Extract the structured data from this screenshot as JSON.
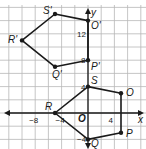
{
  "figure": {
    "type": "coordinate-plane",
    "axes": {
      "x_label": "x",
      "y_label": "y",
      "origin_label": "O",
      "x_ticks": [
        {
          "value": -8,
          "label": "−8"
        },
        {
          "value": -4,
          "label": "−4"
        },
        {
          "value": 4,
          "label": "4"
        }
      ],
      "y_ticks": [
        {
          "value": 4,
          "label": "4"
        },
        {
          "value": -4,
          "label": "−4"
        },
        {
          "value": 8,
          "label": "8"
        },
        {
          "value": 12,
          "label": "12"
        }
      ]
    },
    "colors": {
      "grid": "#b8b8b8",
      "axis": "#1a1a1a",
      "polygon": "#1a1a1a",
      "background": "#ffffff"
    },
    "preimage": {
      "name": "RSOPQ",
      "vertices": [
        {
          "label": "R",
          "x": -5,
          "y": 0
        },
        {
          "label": "S",
          "x": 0,
          "y": 4
        },
        {
          "label": "O",
          "x": 5,
          "y": 3
        },
        {
          "label": "P",
          "x": 5,
          "y": -3
        },
        {
          "label": "Q",
          "x": 0,
          "y": -4
        }
      ]
    },
    "image": {
      "name": "R'S'O'P'Q'",
      "vertices": [
        {
          "label": "R'",
          "x": -10,
          "y": 11
        },
        {
          "label": "S'",
          "x": -5,
          "y": 15
        },
        {
          "label": "O'",
          "x": 0,
          "y": 14
        },
        {
          "label": "P'",
          "x": 0,
          "y": 8
        },
        {
          "label": "Q'",
          "x": -5,
          "y": 7
        }
      ]
    }
  },
  "chart_data": {
    "type": "scatter",
    "title": "",
    "xlabel": "x",
    "ylabel": "y",
    "xlim": [
      -13,
      9
    ],
    "ylim": [
      -5,
      17
    ],
    "grid": true,
    "series": [
      {
        "name": "RSOPQ",
        "closed": true,
        "points": [
          [
            -5,
            0
          ],
          [
            0,
            4
          ],
          [
            5,
            3
          ],
          [
            5,
            -3
          ],
          [
            0,
            -4
          ]
        ],
        "labels": [
          "R",
          "S",
          "O",
          "P",
          "Q"
        ]
      },
      {
        "name": "R'S'O'P'Q'",
        "closed": true,
        "points": [
          [
            -10,
            11
          ],
          [
            -5,
            15
          ],
          [
            0,
            14
          ],
          [
            0,
            8
          ],
          [
            -5,
            7
          ]
        ],
        "labels": [
          "R'",
          "S'",
          "O'",
          "P'",
          "Q'"
        ]
      }
    ],
    "tick_labels": {
      "x": [
        "−8",
        "−4",
        "4"
      ],
      "y": [
        "−4",
        "4",
        "8",
        "12"
      ]
    }
  }
}
